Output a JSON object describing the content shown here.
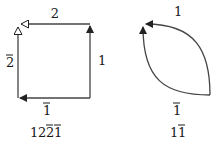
{
  "diagrams": [
    {
      "name": "square-loop",
      "edge_labels": {
        "top": "2",
        "right": "1",
        "bottom": "1",
        "bottom_overlined": true,
        "left": "2",
        "left_overlined": true
      },
      "word": {
        "parts": [
          {
            "text": "1",
            "overline": false
          },
          {
            "text": "2",
            "overline": false
          },
          {
            "text": "2",
            "overline": true
          },
          {
            "text": "1",
            "overline": true
          }
        ]
      }
    },
    {
      "name": "leaf-loop",
      "edge_labels": {
        "top": "1",
        "bottom": "1",
        "bottom_overlined": true
      },
      "word": {
        "parts": [
          {
            "text": "1",
            "overline": false
          },
          {
            "text": "1",
            "overline": true
          }
        ]
      }
    }
  ],
  "colors": {
    "stroke": "#444444",
    "text": "#1a1a1a",
    "background": "#ffffff"
  }
}
